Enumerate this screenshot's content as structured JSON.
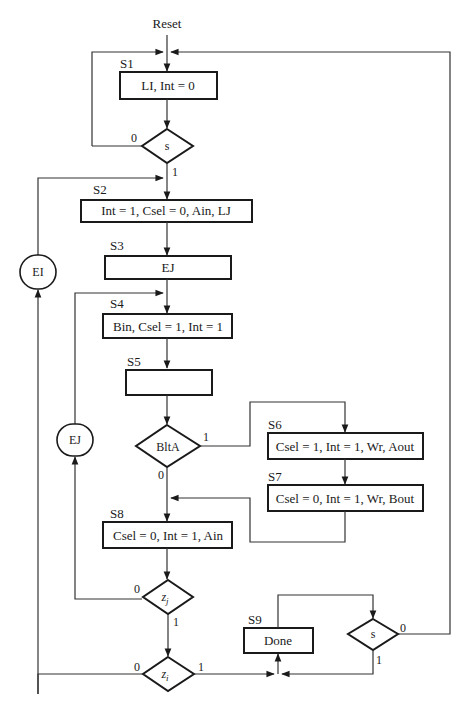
{
  "diagram": {
    "title": "Reset",
    "states": [
      {
        "id": "S1",
        "label": "S1",
        "actions": "LI, Int = 0"
      },
      {
        "id": "S2",
        "label": "S2",
        "actions": "Int = 1, Csel = 0, Ain, LJ"
      },
      {
        "id": "S3",
        "label": "S3",
        "actions": "EJ"
      },
      {
        "id": "S4",
        "label": "S4",
        "actions": "Bin, Csel = 1, Int = 1"
      },
      {
        "id": "S5",
        "label": "S5",
        "actions": ""
      },
      {
        "id": "S6",
        "label": "S6",
        "actions": "Csel = 1, Int = 1, Wr, Aout"
      },
      {
        "id": "S7",
        "label": "S7",
        "actions": "Csel = 0, Int = 1, Wr, Bout"
      },
      {
        "id": "S8",
        "label": "S8",
        "actions": "Csel = 0, Int = 1, Ain"
      },
      {
        "id": "S9",
        "label": "S9",
        "actions": "Done"
      }
    ],
    "decisions": [
      {
        "id": "d-s-top",
        "cond": "s",
        "zero": "0",
        "one": "1"
      },
      {
        "id": "d-bltA",
        "cond": "BltA",
        "zero": "0",
        "one": "1"
      },
      {
        "id": "d-zj",
        "cond": "z",
        "sub": "j",
        "zero": "0",
        "one": "1"
      },
      {
        "id": "d-zi",
        "cond": "z",
        "sub": "i",
        "zero": "0",
        "one": "1"
      },
      {
        "id": "d-s-bottom",
        "cond": "s",
        "zero": "0",
        "one": "1"
      }
    ],
    "conditional_outputs": [
      {
        "id": "ei",
        "label": "EI"
      },
      {
        "id": "ej",
        "label": "EJ"
      }
    ]
  }
}
